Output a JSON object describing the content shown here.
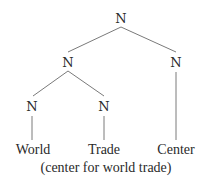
{
  "diagram": {
    "type": "syntax-tree",
    "line_color": "#7a7a7a",
    "text_color": "#2a2a2a",
    "nodes": {
      "root": {
        "label": "N"
      },
      "left": {
        "label": "N"
      },
      "right": {
        "label": "N"
      },
      "left_left": {
        "label": "N"
      },
      "left_right": {
        "label": "N"
      }
    },
    "leaves": [
      {
        "label": "World"
      },
      {
        "label": "Trade"
      },
      {
        "label": "Center"
      }
    ],
    "gloss": "(center for world trade)"
  }
}
